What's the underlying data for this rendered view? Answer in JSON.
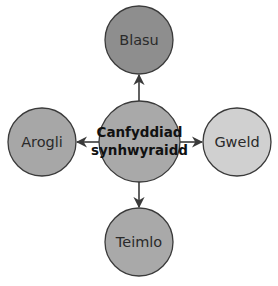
{
  "diagram": {
    "type": "radial concept map",
    "center": {
      "label_line1": "Canfyddiad",
      "label_line2": "synhwyraidd",
      "color": "#a9a9a9"
    },
    "nodes": [
      {
        "id": "top",
        "label": "Blasu",
        "color": "#8e8e8e"
      },
      {
        "id": "left",
        "label": "Arogli",
        "color": "#a7a7a7"
      },
      {
        "id": "right",
        "label": "Gweld",
        "color": "#d0d0d0"
      },
      {
        "id": "bottom",
        "label": "Teimlo",
        "color": "#a9a9a9"
      }
    ],
    "edges": [
      {
        "from": "center",
        "to": "top"
      },
      {
        "from": "center",
        "to": "left"
      },
      {
        "from": "center",
        "to": "right"
      },
      {
        "from": "center",
        "to": "bottom"
      }
    ],
    "stroke_color": "#3a3a3a"
  }
}
